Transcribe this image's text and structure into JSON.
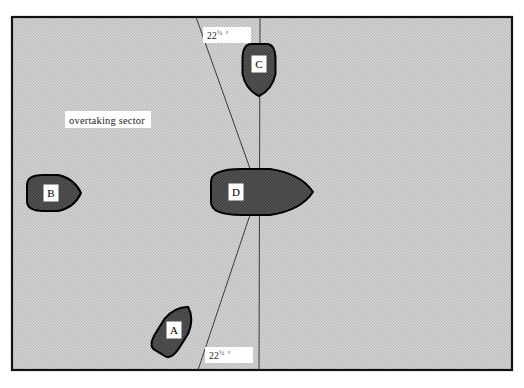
{
  "figure": {
    "title_text": "",
    "background_color": "#ffffff",
    "sector_fill_color": "#d2d2d2",
    "sector_border_color": "#111111",
    "vessel_fill_color": "#4a4a4a",
    "vessel_border_color": "#000000",
    "line_color": "#3a3a3a",
    "label_box_color": "#ffffff",
    "text_color": "#1a1a1a"
  },
  "sector": {
    "name": "overtaking-sector",
    "label": "overtaking sector",
    "x": 12,
    "y": 17,
    "width": 500,
    "height": 353
  },
  "angle_labels": [
    {
      "id": "top",
      "text": "22",
      "fraction": "½",
      "degree": "°",
      "x": 208,
      "y": 38
    },
    {
      "id": "bottom",
      "text": "22",
      "fraction": "½",
      "degree": "°",
      "x": 210,
      "y": 358
    }
  ],
  "reference_lines": {
    "vertical": {
      "name": "heading-reference-line",
      "x1": 260,
      "y1": 17,
      "x2": 259,
      "y2": 370
    },
    "upper_sector_boundary": {
      "name": "sector-boundary-upper",
      "x1": 196,
      "y1": 17,
      "x2": 258,
      "y2": 191
    },
    "lower_sector_boundary": {
      "name": "sector-boundary-lower",
      "x1": 198,
      "y1": 370,
      "x2": 258,
      "y2": 191
    }
  },
  "vessels": [
    {
      "id": "A",
      "label": "A",
      "name": "vessel-a",
      "cx": 174,
      "cy": 330,
      "length": 54,
      "beam": 28,
      "rotation": -58,
      "heading_description": "up-right"
    },
    {
      "id": "B",
      "label": "B",
      "name": "vessel-b",
      "cx": 54,
      "cy": 193,
      "length": 54,
      "beam": 36,
      "rotation": 0,
      "heading_description": "right"
    },
    {
      "id": "C",
      "label": "C",
      "name": "vessel-c",
      "cx": 259,
      "cy": 70,
      "length": 52,
      "beam": 33,
      "rotation": 90,
      "heading_description": "down"
    },
    {
      "id": "D",
      "label": "D",
      "name": "vessel-d",
      "cx": 262,
      "cy": 192,
      "length": 102,
      "beam": 46,
      "rotation": 0,
      "heading_description": "right"
    }
  ]
}
